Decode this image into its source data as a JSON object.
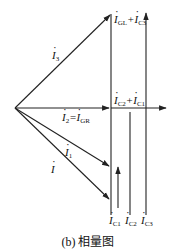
{
  "figure": {
    "caption": "(b) 相量图",
    "type": "phasor diagram"
  },
  "phasors": {
    "I3": {
      "symbol": "I",
      "sub": "3"
    },
    "I2": {
      "symbol": "I",
      "sub": "2",
      "eq": "=",
      "eq_symbol": "I",
      "eq_sub": "GR"
    },
    "I1": {
      "symbol": "I",
      "sub": "1"
    },
    "I": {
      "symbol": "I",
      "sub": ""
    },
    "IGL_IC3": {
      "a": "I",
      "a_sub": "GL",
      "op": "+",
      "b": "I",
      "b_sub": "C3"
    },
    "IC2_IC1": {
      "a": "I",
      "a_sub": "C2",
      "op": "+",
      "b": "I",
      "b_sub": "C1"
    },
    "IC1": {
      "symbol": "I",
      "sub": "C1"
    },
    "IC2": {
      "symbol": "I",
      "sub": "C2"
    },
    "IC3": {
      "symbol": "I",
      "sub": "C3"
    }
  },
  "colors": {
    "line": "#222222",
    "background": "#ffffff"
  }
}
